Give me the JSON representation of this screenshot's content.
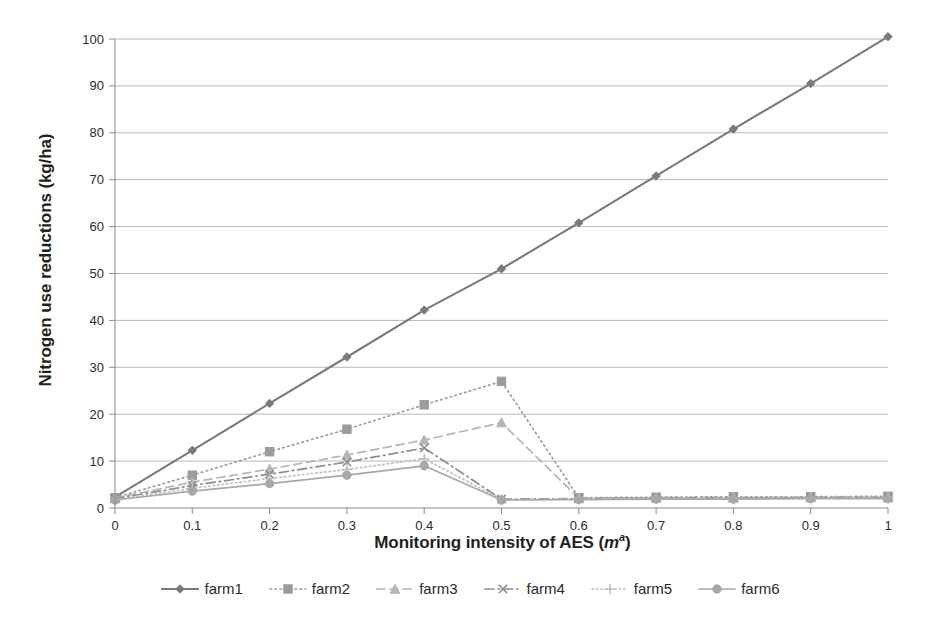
{
  "chart_data": {
    "type": "line",
    "title": "",
    "xlabel": "Monitoring intensity of AES (mᵃ)",
    "xlabel_parts": {
      "prefix": "Monitoring intensity of AES (",
      "symbol": "m",
      "superscript": "a",
      "suffix": ")"
    },
    "ylabel": "Nitrogen use reductions (kg/ha)",
    "x": [
      0,
      0.1,
      0.2,
      0.3,
      0.4,
      0.5,
      0.6,
      0.7,
      0.8,
      0.9,
      1
    ],
    "xtick_labels": [
      "0",
      "0.1",
      "0.2",
      "0.3",
      "0.4",
      "0.5",
      "0.6",
      "0.7",
      "0.8",
      "0.9",
      "1"
    ],
    "ytick_labels": [
      "0",
      "10",
      "20",
      "30",
      "40",
      "50",
      "60",
      "70",
      "80",
      "90",
      "100"
    ],
    "xlim": [
      0,
      1
    ],
    "ylim": [
      0,
      100
    ],
    "grid": "horizontal",
    "legend_position": "bottom",
    "series": [
      {
        "name": "farm1",
        "values": [
          2.3,
          12.3,
          22.3,
          32.2,
          42.2,
          51.0,
          60.8,
          70.8,
          80.8,
          90.5,
          100.5
        ],
        "color": "#7a7a7a",
        "dash": "none",
        "marker": "diamond"
      },
      {
        "name": "farm2",
        "values": [
          2.2,
          7.0,
          12.0,
          16.8,
          22.0,
          27.0,
          2.2,
          2.3,
          2.4,
          2.4,
          2.5
        ],
        "color": "#9c9c9c",
        "dash": "dotted",
        "marker": "square"
      },
      {
        "name": "farm3",
        "values": [
          2.1,
          5.5,
          8.3,
          11.3,
          14.5,
          18.2,
          2.1,
          2.2,
          2.2,
          2.3,
          2.3
        ],
        "color": "#b5b5b5",
        "dash": "dashed",
        "marker": "triangle"
      },
      {
        "name": "farm4",
        "values": [
          2.0,
          4.8,
          7.2,
          9.8,
          12.8,
          1.9,
          2.0,
          2.1,
          2.1,
          2.2,
          2.2
        ],
        "color": "#8d8d8d",
        "dash": "dashdot",
        "marker": "cross"
      },
      {
        "name": "farm5",
        "values": [
          1.8,
          4.2,
          6.3,
          8.2,
          10.5,
          1.8,
          1.9,
          2.0,
          2.0,
          2.1,
          2.1
        ],
        "color": "#c0c0c0",
        "dash": "dotted2",
        "marker": "plus"
      },
      {
        "name": "farm6",
        "values": [
          1.7,
          3.6,
          5.2,
          7.0,
          9.0,
          1.7,
          1.8,
          1.9,
          1.9,
          2.0,
          2.0
        ],
        "color": "#a8a8a8",
        "dash": "solid-light",
        "marker": "circle"
      }
    ]
  },
  "legend": {
    "items": [
      {
        "label": "farm1"
      },
      {
        "label": "farm2"
      },
      {
        "label": "farm3"
      },
      {
        "label": "farm4"
      },
      {
        "label": "farm5"
      },
      {
        "label": "farm6"
      }
    ]
  }
}
